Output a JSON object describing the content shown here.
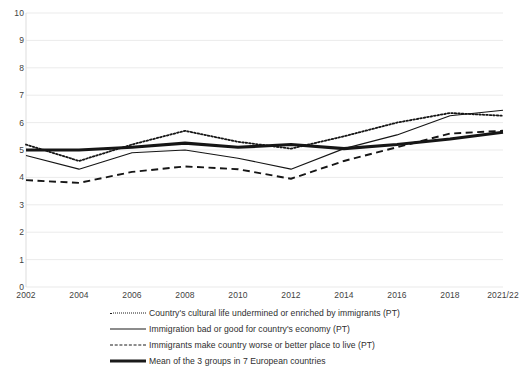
{
  "chart_data": {
    "type": "line",
    "title": "",
    "xlabel": "",
    "ylabel": "",
    "ylim": [
      0,
      10
    ],
    "grid": true,
    "legend_position": "bottom",
    "categories": [
      "2002",
      "2004",
      "2006",
      "2008",
      "2010",
      "2012",
      "2014",
      "2016",
      "2018",
      "2021/22"
    ],
    "yticks": [
      "10",
      "9",
      "8",
      "7",
      "6",
      "5",
      "4",
      "3",
      "2",
      "1",
      "0"
    ],
    "series": [
      {
        "name": "Country's cultural life undermined or enriched by immigrants (PT)",
        "style": "dotted",
        "values": [
          5.2,
          4.6,
          5.2,
          5.7,
          5.3,
          5.05,
          5.5,
          6.0,
          6.35,
          6.25
        ]
      },
      {
        "name": "Immigration bad or good for country's economy (PT)",
        "style": "solid",
        "values": [
          4.8,
          4.3,
          4.9,
          5.0,
          4.7,
          4.3,
          5.05,
          5.55,
          6.25,
          6.45
        ]
      },
      {
        "name": "Immigrants make country worse or  better place to live (PT)",
        "style": "dashed",
        "values": [
          3.9,
          3.8,
          4.2,
          4.4,
          4.3,
          3.95,
          4.6,
          5.1,
          5.6,
          5.7
        ]
      },
      {
        "name": "Mean of the 3 groups in 7 European countries",
        "style": "thick-solid",
        "values": [
          5.0,
          5.0,
          5.1,
          5.25,
          5.1,
          5.2,
          5.05,
          5.2,
          5.4,
          5.65
        ]
      }
    ]
  },
  "legend": {
    "items": [
      {
        "label": "Country's cultural life undermined or enriched by immigrants (PT)",
        "key": "dotted-line-key"
      },
      {
        "label": "Immigration bad or good for country's economy (PT)",
        "key": "solid-line-key"
      },
      {
        "label": "Immigrants make country worse or  better place to live (PT)",
        "key": "dashed-line-key"
      },
      {
        "label": "Mean of the 3 groups in 7 European countries",
        "key": "thick-line-key"
      }
    ]
  }
}
